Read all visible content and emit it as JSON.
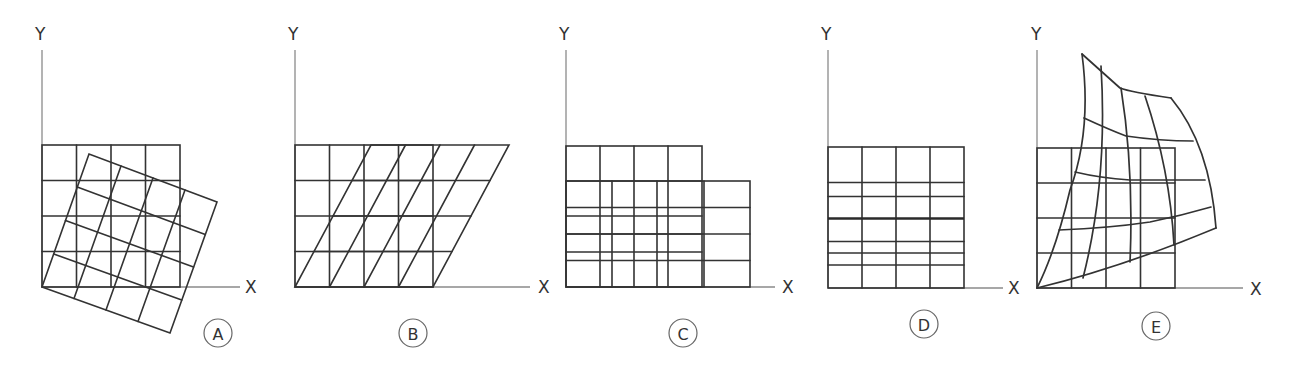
{
  "figure": {
    "colors": {
      "grid": "#333333",
      "axis": "#8a8a8a",
      "background": "#ffffff"
    },
    "panels": [
      {
        "id": "A",
        "letter": "A",
        "transform": "rotation",
        "y_label": "Y",
        "x_label": "X",
        "origin": [
          42,
          287
        ],
        "cell": 34.5,
        "rotation_deg": -20
      },
      {
        "id": "B",
        "letter": "B",
        "transform": "shear-x",
        "y_label": "Y",
        "x_label": "X",
        "origin": [
          295,
          287
        ],
        "cell": 34.5,
        "shear_offset": 78
      },
      {
        "id": "C",
        "letter": "C",
        "transform": "non-uniform scale",
        "y_label": "Y",
        "x_label": "X",
        "origin": [
          566,
          287
        ],
        "cell": 34
      },
      {
        "id": "D",
        "letter": "D",
        "transform": "vertical scale",
        "y_label": "Y",
        "x_label": "X",
        "origin": [
          828,
          288
        ],
        "cell": 34
      },
      {
        "id": "E",
        "letter": "E",
        "transform": "free-form warp",
        "y_label": "Y",
        "x_label": "X",
        "origin": [
          1037,
          288
        ],
        "cell": 34.5
      }
    ]
  }
}
